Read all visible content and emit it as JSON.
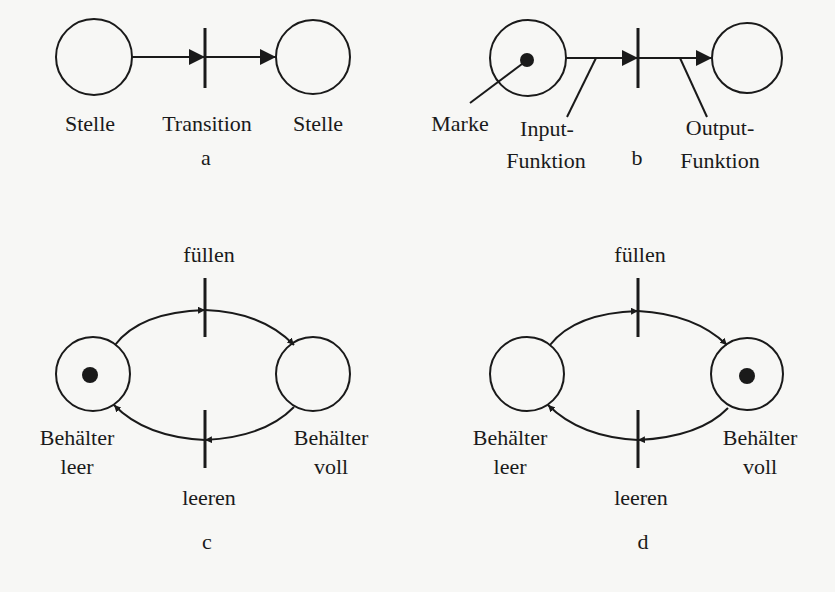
{
  "panels": {
    "a": {
      "caption": "a",
      "labels": {
        "place_left": "Stelle",
        "transition": "Transition",
        "place_right": "Stelle"
      }
    },
    "b": {
      "caption": "b",
      "labels": {
        "token": "Marke",
        "input_line1": "Input-",
        "input_line2": "Funktion",
        "output_line1": "Output-",
        "output_line2": "Funktion"
      }
    },
    "c": {
      "caption": "c",
      "labels": {
        "transition_top": "füllen",
        "transition_bottom": "leeren",
        "left_line1": "Behälter",
        "left_line2": "leer",
        "right_line1": "Behälter",
        "right_line2": "voll"
      },
      "token_in": "Behälter leer"
    },
    "d": {
      "caption": "d",
      "labels": {
        "transition_top": "füllen",
        "transition_bottom": "leeren",
        "left_line1": "Behälter",
        "left_line2": "leer",
        "right_line1": "Behälter",
        "right_line2": "voll"
      },
      "token_in": "Behälter voll"
    }
  },
  "colors": {
    "stroke": "#1a1a1a",
    "background": "#f7f7f5"
  }
}
